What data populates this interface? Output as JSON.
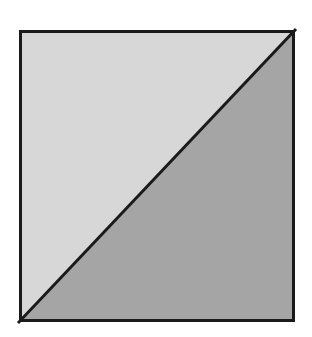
{
  "figure": {
    "name": "square-divided-by-diagonal",
    "caption": "",
    "background_color": "#ffffff",
    "canvas": {
      "width": 312,
      "height": 337
    },
    "square": {
      "name": "outer-square",
      "left": 19,
      "top": 30,
      "right": 295,
      "bottom": 322,
      "width": 276,
      "height": 292,
      "stroke_color": "#1a1a1a",
      "stroke_width": 3
    },
    "diagonal": {
      "name": "diagonal-line",
      "from": {
        "x": 19,
        "y": 322
      },
      "to": {
        "x": 295,
        "y": 30
      },
      "direction": "bottom-left-to-top-right",
      "stroke_color": "#1a1a1a",
      "stroke_width": 3
    },
    "regions": [
      {
        "name": "upper-left-triangle",
        "label": "",
        "fill_color": "#dadada",
        "vertices": [
          {
            "x": 19,
            "y": 30
          },
          {
            "x": 295,
            "y": 30
          },
          {
            "x": 19,
            "y": 322
          }
        ]
      },
      {
        "name": "lower-right-triangle",
        "label": "",
        "fill_color": "#9c9c9c",
        "vertices": [
          {
            "x": 295,
            "y": 30
          },
          {
            "x": 295,
            "y": 322
          },
          {
            "x": 19,
            "y": 322
          }
        ]
      }
    ]
  }
}
